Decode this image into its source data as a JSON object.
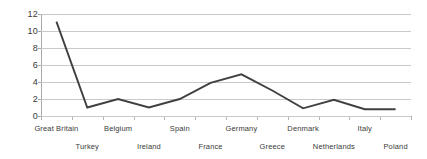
{
  "chart_data": {
    "type": "line",
    "title": "",
    "subtitle": "",
    "xlabel": "",
    "ylabel": "",
    "categories": [
      "Great Britain",
      "Turkey",
      "Belgium",
      "Ireland",
      "Spain",
      "France",
      "Germany",
      "Greece",
      "Denmark",
      "Netherlands",
      "Italy",
      "Poland"
    ],
    "values": [
      11.1,
      1.0,
      2.0,
      1.0,
      2.0,
      3.9,
      4.9,
      3.0,
      0.9,
      1.9,
      0.8,
      0.8
    ],
    "series": [
      {
        "name": "",
        "values": [
          11.1,
          1.0,
          2.0,
          1.0,
          2.0,
          3.9,
          4.9,
          3.0,
          0.9,
          1.9,
          0.8,
          0.8
        ]
      }
    ],
    "ylim": [
      0,
      12
    ],
    "yticks": [
      0,
      2,
      4,
      6,
      8,
      10,
      12
    ],
    "ytick_labels": [
      "0",
      "2",
      "4",
      "6",
      "8",
      "10",
      "12"
    ],
    "grid": true,
    "grid_axis": "y",
    "legend": false,
    "legend_position": "none",
    "line_color": "#404040",
    "grid_color": "#c9c9c9",
    "axis_color": "#a8a8a8",
    "text_color": "#3a3a3a",
    "background_color": "#ffffff",
    "markers": false,
    "label_rows": [
      0,
      1,
      0,
      1,
      0,
      1,
      0,
      1,
      0,
      1,
      0,
      1
    ]
  }
}
